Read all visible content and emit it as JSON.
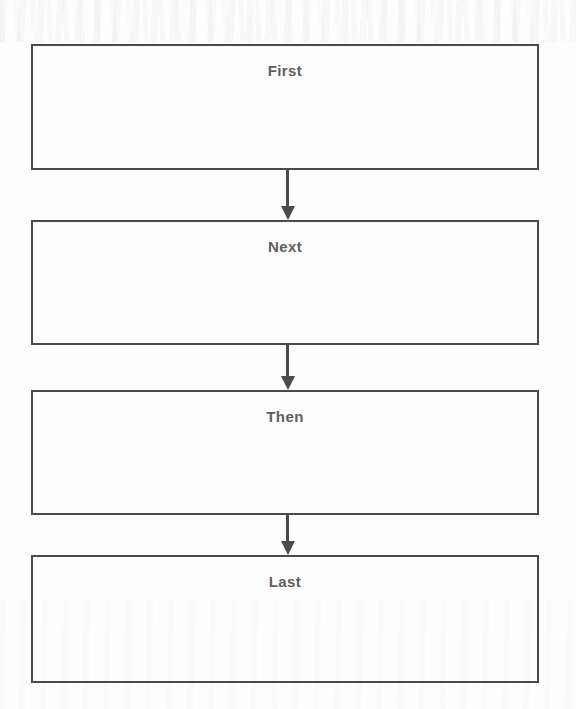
{
  "diagram": {
    "type": "flowchart",
    "orientation": "vertical",
    "title": "",
    "colors": {
      "box_border": "#4a4a4a",
      "label_text": "#5f5f5f",
      "arrow": "#4a4a4a",
      "background": "#fdfdfd"
    },
    "nodes": [
      {
        "id": "node-1",
        "label": "First"
      },
      {
        "id": "node-2",
        "label": "Next"
      },
      {
        "id": "node-3",
        "label": "Then"
      },
      {
        "id": "node-4",
        "label": "Last"
      }
    ],
    "connectors": [
      {
        "id": "arrow-1",
        "from": "First",
        "to": "Next",
        "shape": "down-arrow"
      },
      {
        "id": "arrow-2",
        "from": "Next",
        "to": "Then",
        "shape": "down-arrow"
      },
      {
        "id": "arrow-3",
        "from": "Then",
        "to": "Last",
        "shape": "down-arrow"
      }
    ]
  }
}
